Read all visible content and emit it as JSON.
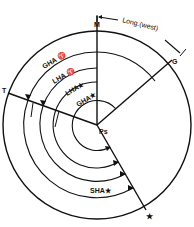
{
  "diagram": {
    "points": {
      "meridian": "M",
      "greenwich": "G",
      "aries": "T",
      "pole": "Ps",
      "star": "★"
    },
    "labels": {
      "longitude": "Long.(west)",
      "gha_aries": "GHA ♈",
      "lha_aries": "LHA ♈",
      "lha_star": "LHA★",
      "gha_star": "GHA★",
      "sha_star": "SHA★"
    },
    "colors": {
      "ink": "#111111",
      "background": "#ffffff"
    }
  }
}
